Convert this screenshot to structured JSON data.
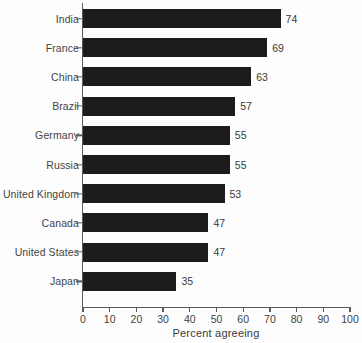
{
  "chart_data": {
    "type": "bar",
    "orientation": "horizontal",
    "title": "",
    "subtitle": "",
    "xlabel": "Percent agreeing",
    "ylabel": "",
    "xlim": [
      0,
      100
    ],
    "xticks": [
      0,
      10,
      20,
      30,
      40,
      50,
      60,
      70,
      80,
      90,
      100
    ],
    "grid": false,
    "legend": null,
    "bar_color": "#1c1c1c",
    "background_color": "#fdfdfd",
    "axis_color": "#5a5a5a",
    "show_value_labels": true,
    "categories": [
      "India",
      "France",
      "China",
      "Brazil",
      "Germany",
      "Russia",
      "United Kingdom",
      "Canada",
      "United States",
      "Japan"
    ],
    "values": [
      74,
      69,
      63,
      57,
      55,
      55,
      53,
      47,
      47,
      35
    ],
    "value_labels": [
      "74",
      "69",
      "63",
      "57",
      "55",
      "55",
      "53",
      "47",
      "47",
      "35"
    ],
    "xtick_labels": [
      "0",
      "10",
      "20",
      "30",
      "40",
      "50",
      "60",
      "70",
      "80",
      "90",
      "100"
    ]
  }
}
